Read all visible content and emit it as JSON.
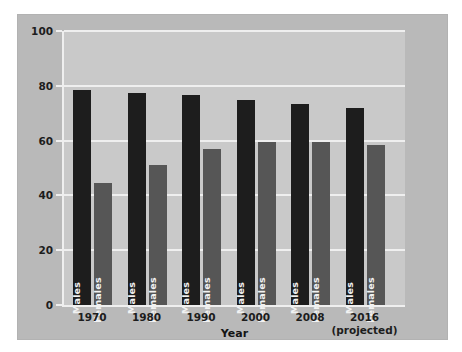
{
  "chart_data": {
    "type": "bar",
    "title": "",
    "xlabel": "Year",
    "ylabel": "Participation rate (percent)",
    "ylim": [
      0,
      100
    ],
    "yticks": [
      0,
      20,
      40,
      60,
      80,
      100
    ],
    "grid": true,
    "legend": "none",
    "categories": [
      "1970",
      "1980",
      "1990",
      "2000",
      "2008",
      "2016"
    ],
    "category_sublabels": [
      "",
      "",
      "",
      "",
      "",
      "(projected)"
    ],
    "series": [
      {
        "name": "Males",
        "color": "#1d1d1d",
        "values": [
          78.5,
          77.5,
          76.5,
          75.0,
          73.5,
          72.0
        ]
      },
      {
        "name": "Females",
        "color": "#565656",
        "values": [
          44.5,
          51.0,
          57.0,
          59.5,
          59.5,
          58.5
        ]
      }
    ],
    "bar_labels": [
      "Males",
      "Females"
    ],
    "colors": {
      "figure_background": "#b9b9b9",
      "plot_background": "#c9c9c9",
      "gridline": "#efefef",
      "males_bar": "#1d1d1d",
      "females_bar": "#565656",
      "text": "#1d1d1d"
    }
  }
}
